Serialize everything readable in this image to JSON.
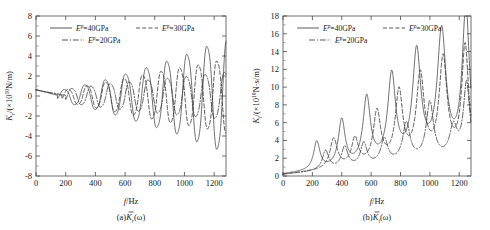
{
  "figure": {
    "panels": [
      {
        "id": "panel-a",
        "caption": "(a)",
        "caption_symbol": "K",
        "caption_sub": "r",
        "caption_arg": "(ω)",
        "xlabel_italic": "f",
        "xlabel_rest": "/Hz",
        "ylabel_symbol": "K",
        "ylabel_sub": "r",
        "ylabel_unit_pre": "/(×10",
        "ylabel_unit_exp": "10",
        "ylabel_unit_post": "N/m)",
        "legend": [
          {
            "label_sym": "E",
            "label_sup": "p",
            "label_rest": "=40GPa",
            "style": "solid"
          },
          {
            "label_sym": "E",
            "label_sup": "p",
            "label_rest": "=30GPa",
            "style": "dashed"
          },
          {
            "label_sym": "E",
            "label_sup": "p",
            "label_rest": "=20GPa",
            "style": "dashdot"
          }
        ]
      },
      {
        "id": "panel-b",
        "caption": "(b)",
        "caption_symbol": "K",
        "caption_sub": "i",
        "caption_arg": "(ω)",
        "xlabel_italic": "f",
        "xlabel_rest": "/Hz",
        "ylabel_symbol": "K",
        "ylabel_sub": "i",
        "ylabel_unit_pre": "/(×10",
        "ylabel_unit_exp": "10",
        "ylabel_unit_post": "N·s/m)",
        "legend": [
          {
            "label_sym": "E",
            "label_sup": "p",
            "label_rest": "=40GPa",
            "style": "solid"
          },
          {
            "label_sym": "E",
            "label_sup": "p",
            "label_rest": "=30GPa",
            "style": "dashed"
          },
          {
            "label_sym": "E",
            "label_sup": "p",
            "label_rest": "=20GPa",
            "style": "dashdot"
          }
        ]
      }
    ]
  },
  "chart_data": [
    {
      "type": "line",
      "title": "",
      "panel": "(a)",
      "xlabel": "f/Hz",
      "ylabel": "K_r (×10^10 N/m)",
      "xlim": [
        0,
        1280
      ],
      "ylim": [
        -8,
        8
      ],
      "xticks": [
        0,
        200,
        400,
        600,
        800,
        1000,
        1200
      ],
      "yticks": [
        -8,
        -6,
        -4,
        -2,
        0,
        2,
        4,
        6,
        8
      ],
      "grid": false,
      "legend_position": "top-left",
      "series": [
        {
          "name": "E^p=40GPa",
          "style": "solid",
          "start_value": 0.65,
          "resonances": [
            {
              "f": 145,
              "amp": 0.55
            },
            {
              "f": 285,
              "amp": 1.05
            },
            {
              "f": 425,
              "amp": 1.6
            },
            {
              "f": 560,
              "amp": 2.2
            },
            {
              "f": 700,
              "amp": 2.9
            },
            {
              "f": 840,
              "amp": 3.6
            },
            {
              "f": 975,
              "amp": 4.3
            },
            {
              "f": 1110,
              "amp": 5.2
            },
            {
              "f": 1245,
              "amp": 6.0
            }
          ]
        },
        {
          "name": "E^p=30GPa",
          "style": "dashed",
          "start_value": 0.6,
          "resonances": [
            {
              "f": 175,
              "amp": 0.6
            },
            {
              "f": 305,
              "amp": 1.0
            },
            {
              "f": 430,
              "amp": 1.4
            },
            {
              "f": 555,
              "amp": 1.8
            },
            {
              "f": 680,
              "amp": 2.2
            },
            {
              "f": 805,
              "amp": 2.6
            },
            {
              "f": 930,
              "amp": 3.0
            },
            {
              "f": 1055,
              "amp": 3.3
            },
            {
              "f": 1180,
              "amp": 3.7
            }
          ]
        },
        {
          "name": "E^p=20GPa",
          "style": "dashdot",
          "start_value": 0.6,
          "resonances": [
            {
              "f": 200,
              "amp": 0.75
            },
            {
              "f": 330,
              "amp": 1.0
            },
            {
              "f": 460,
              "amp": 1.25
            },
            {
              "f": 590,
              "amp": 1.5
            },
            {
              "f": 715,
              "amp": 1.7
            },
            {
              "f": 845,
              "amp": 1.9
            },
            {
              "f": 975,
              "amp": 2.1
            },
            {
              "f": 1100,
              "amp": 2.3
            },
            {
              "f": 1230,
              "amp": 2.5
            }
          ]
        }
      ]
    },
    {
      "type": "line",
      "title": "",
      "panel": "(b)",
      "xlabel": "f/Hz",
      "ylabel": "K_i (×10^10 N·s/m)",
      "xlim": [
        0,
        1280
      ],
      "ylim": [
        0,
        18
      ],
      "xticks": [
        0,
        200,
        400,
        600,
        800,
        1000,
        1200
      ],
      "yticks": [
        0,
        2,
        4,
        6,
        8,
        10,
        12,
        14,
        16,
        18
      ],
      "grid": false,
      "legend_position": "top-left",
      "series": [
        {
          "name": "E^p=40GPa",
          "style": "solid",
          "baseline": 0.15,
          "peaks": [
            {
              "f": 230,
              "height": 3.3,
              "width": 26
            },
            {
              "f": 400,
              "height": 5.4,
              "width": 28
            },
            {
              "f": 570,
              "height": 7.6,
              "width": 30
            },
            {
              "f": 740,
              "height": 9.8,
              "width": 32
            },
            {
              "f": 910,
              "height": 12.1,
              "width": 34
            },
            {
              "f": 1080,
              "height": 14.1,
              "width": 36
            },
            {
              "f": 1245,
              "height": 16.5,
              "width": 30
            }
          ]
        },
        {
          "name": "E^p=30GPa",
          "style": "dashed",
          "baseline": 0.15,
          "peaks": [
            {
              "f": 345,
              "height": 3.5,
              "width": 30
            },
            {
              "f": 490,
              "height": 3.2,
              "width": 28
            },
            {
              "f": 640,
              "height": 6.0,
              "width": 30
            },
            {
              "f": 790,
              "height": 7.9,
              "width": 30
            },
            {
              "f": 935,
              "height": 9.5,
              "width": 32
            },
            {
              "f": 1090,
              "height": 11.1,
              "width": 32
            },
            {
              "f": 1240,
              "height": 12.4,
              "width": 28
            }
          ]
        },
        {
          "name": "E^p=20GPa",
          "style": "dashdot",
          "baseline": 0.15,
          "peaks": [
            {
              "f": 290,
              "height": 2.3,
              "width": 26
            },
            {
              "f": 420,
              "height": 2.5,
              "width": 26
            },
            {
              "f": 550,
              "height": 2.7,
              "width": 26
            },
            {
              "f": 690,
              "height": 2.9,
              "width": 28
            },
            {
              "f": 840,
              "height": 4.4,
              "width": 30
            },
            {
              "f": 1000,
              "height": 6.5,
              "width": 30
            },
            {
              "f": 1160,
              "height": 3.4,
              "width": 30
            },
            {
              "f": 1250,
              "height": 8.3,
              "width": 26
            }
          ]
        }
      ]
    }
  ]
}
